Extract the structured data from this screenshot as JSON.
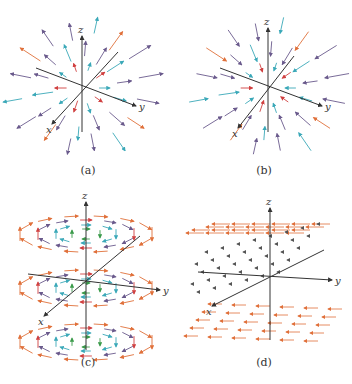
{
  "figure": {
    "panels": [
      {
        "id": "a",
        "caption": "(a)",
        "description": "Radial vector field pointing outward from origin",
        "axes": {
          "x": "x",
          "y": "y",
          "z": "z"
        }
      },
      {
        "id": "b",
        "caption": "(b)",
        "description": "Radial vector field pointing inward toward origin",
        "axes": {
          "x": "x",
          "y": "y",
          "z": "z"
        }
      },
      {
        "id": "c",
        "caption": "(c)",
        "description": "Rotational vector field circulating around z-axis in horizontal layers",
        "axes": {
          "x": "x",
          "y": "y",
          "z": "z"
        }
      },
      {
        "id": "d",
        "caption": "(d)",
        "description": "Vector field in -y direction, magnitude growing with |z|",
        "axes": {
          "x": "x",
          "y": "y",
          "z": "z"
        }
      }
    ],
    "colors": {
      "axis": "#333333",
      "orange": "#e0703a",
      "purple": "#6a5a8c",
      "cyan": "#3aa8b8",
      "green": "#3a9a4a",
      "red": "#d04040",
      "gray": "#555555"
    }
  }
}
